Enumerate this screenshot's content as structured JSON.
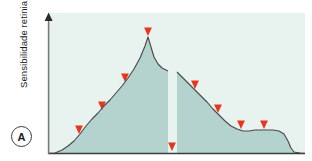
{
  "figure": {
    "panel_letter": "A",
    "y_axis_label": "Sensibilidade retiniana",
    "x_axis_label": ""
  },
  "colors": {
    "plot_background": "#e8f3ef",
    "curve_fill": "#b4d2ce",
    "curve_stroke": "#4a4a4a",
    "axis": "#3c3c3c",
    "arrow_red": "#e8351c",
    "arrow_fade": "#f6b9ab",
    "page_background": "#ffffff",
    "text": "#1b1b1b"
  },
  "chart_data": {
    "type": "area",
    "title": "",
    "subtitle": "",
    "xlabel": "",
    "ylabel": "Sensibilidade retiniana",
    "grid": false,
    "legend": null,
    "xlim": [
      48,
      305
    ],
    "ylim": [
      153,
      20
    ],
    "axis_style": {
      "y_axis_arrow": true,
      "x_axis_arrow": false,
      "ticks": false,
      "tick_labels": false
    },
    "annotations": [
      {
        "name": "panel-letter",
        "text": "A",
        "x": 21,
        "y": 136
      }
    ],
    "series": [
      {
        "name": "Curva de sensibilidade retiniana (segmento nasal)",
        "type": "area",
        "points": [
          [
            55,
            153
          ],
          [
            62,
            150
          ],
          [
            68,
            146
          ],
          [
            74,
            141
          ],
          [
            80,
            134
          ],
          [
            86,
            126
          ],
          [
            92,
            119
          ],
          [
            98,
            113
          ],
          [
            104,
            106
          ],
          [
            110,
            100
          ],
          [
            116,
            93
          ],
          [
            122,
            86
          ],
          [
            128,
            78
          ],
          [
            134,
            69
          ],
          [
            140,
            58
          ],
          [
            145,
            46
          ],
          [
            148,
            37
          ],
          [
            151,
            47
          ],
          [
            154,
            57
          ],
          [
            158,
            64
          ],
          [
            162,
            68
          ],
          [
            166,
            70
          ],
          [
            168,
            71
          ]
        ]
      },
      {
        "name": "Curva de sensibilidade retiniana (segmento temporal)",
        "type": "area",
        "points": [
          [
            177,
            72
          ],
          [
            183,
            78
          ],
          [
            189,
            84
          ],
          [
            195,
            90
          ],
          [
            201,
            96
          ],
          [
            207,
            102
          ],
          [
            213,
            109
          ],
          [
            219,
            115
          ],
          [
            225,
            121
          ],
          [
            231,
            126
          ],
          [
            237,
            129
          ],
          [
            243,
            131
          ],
          [
            249,
            131
          ],
          [
            255,
            130
          ],
          [
            261,
            130
          ],
          [
            267,
            130
          ],
          [
            273,
            130
          ],
          [
            279,
            131
          ],
          [
            284,
            134
          ],
          [
            288,
            141
          ],
          [
            291,
            148
          ],
          [
            294,
            152
          ],
          [
            300,
            153
          ]
        ]
      }
    ],
    "gap": {
      "name": "ponto-cego",
      "description": "Descontinuidade na curva (disco optico / ponto cego)",
      "x_start": 168,
      "x_end": 177
    },
    "arrows": [
      {
        "id": 1,
        "x": 79,
        "y_start": 16,
        "y_end": 134,
        "label": "seta-luz-1",
        "reaches_baseline": false
      },
      {
        "id": 2,
        "x": 102,
        "y_start": 16,
        "y_end": 110,
        "label": "seta-luz-2",
        "reaches_baseline": false
      },
      {
        "id": 3,
        "x": 125,
        "y_start": 16,
        "y_end": 82,
        "label": "seta-luz-3",
        "reaches_baseline": false
      },
      {
        "id": 4,
        "x": 148,
        "y_start": 16,
        "y_end": 36,
        "label": "seta-luz-4-fovea",
        "reaches_baseline": false
      },
      {
        "id": 5,
        "x": 172,
        "y_start": 16,
        "y_end": 151,
        "label": "seta-luz-5-ponto-cego",
        "reaches_baseline": true
      },
      {
        "id": 6,
        "x": 195,
        "y_start": 16,
        "y_end": 89,
        "label": "seta-luz-6",
        "reaches_baseline": false
      },
      {
        "id": 7,
        "x": 218,
        "y_start": 16,
        "y_end": 113,
        "label": "seta-luz-7",
        "reaches_baseline": false
      },
      {
        "id": 8,
        "x": 241,
        "y_start": 16,
        "y_end": 129,
        "label": "seta-luz-8",
        "reaches_baseline": false
      },
      {
        "id": 9,
        "x": 264,
        "y_start": 16,
        "y_end": 129,
        "label": "seta-luz-9",
        "reaches_baseline": false
      }
    ]
  }
}
